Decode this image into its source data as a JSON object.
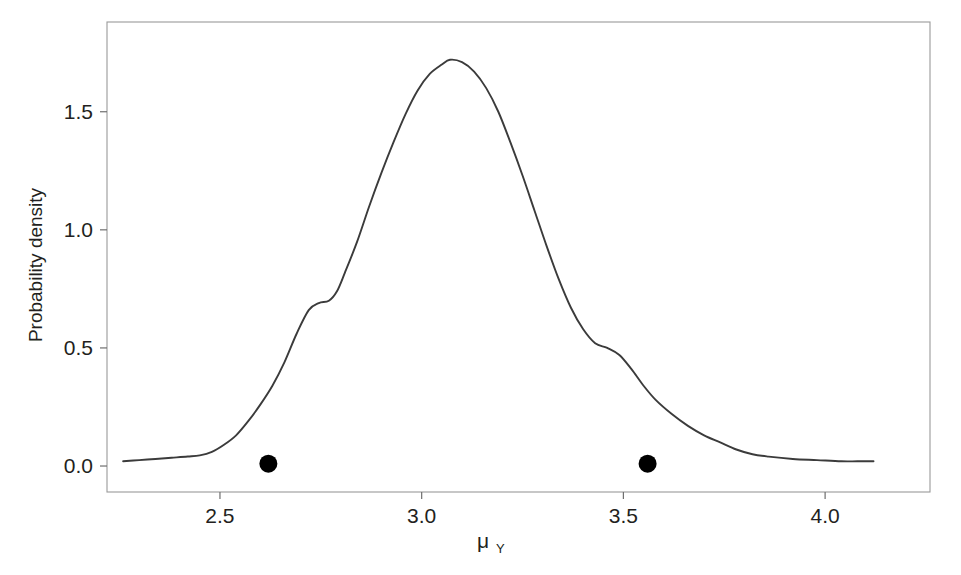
{
  "chart_data": {
    "type": "line",
    "title": "",
    "subtitle": "",
    "xlabel": "μ",
    "xlabel_subscript": "Y",
    "ylabel": "Probability density",
    "xlim": [
      2.22,
      4.26
    ],
    "ylim": [
      -0.11,
      1.88
    ],
    "xticks": [
      2.5,
      3.0,
      3.5,
      4.0
    ],
    "xtick_labels": [
      "2.5",
      "3.0",
      "3.5",
      "4.0"
    ],
    "yticks": [
      0.0,
      0.5,
      1.0,
      1.5
    ],
    "ytick_labels": [
      "0.0",
      "0.5",
      "1.0",
      "1.5"
    ],
    "grid": false,
    "legend": null,
    "line_color": "#3b3b3b",
    "marker_color": "#000000",
    "frame_color": "#8c8c8c",
    "background": "#ffffff",
    "series": [
      {
        "name": "posterior density",
        "type": "line",
        "x": [
          2.26,
          2.3,
          2.34,
          2.38,
          2.42,
          2.45,
          2.48,
          2.51,
          2.54,
          2.57,
          2.6,
          2.63,
          2.66,
          2.69,
          2.72,
          2.745,
          2.77,
          2.79,
          2.81,
          2.84,
          2.87,
          2.9,
          2.93,
          2.96,
          2.99,
          3.02,
          3.05,
          3.07,
          3.1,
          3.13,
          3.16,
          3.19,
          3.22,
          3.25,
          3.28,
          3.31,
          3.34,
          3.37,
          3.4,
          3.43,
          3.46,
          3.49,
          3.52,
          3.55,
          3.58,
          3.62,
          3.66,
          3.7,
          3.74,
          3.78,
          3.82,
          3.86,
          3.92,
          3.98,
          4.04,
          4.08,
          4.12
        ],
        "y": [
          0.02,
          0.025,
          0.03,
          0.035,
          0.04,
          0.045,
          0.06,
          0.09,
          0.13,
          0.19,
          0.26,
          0.34,
          0.44,
          0.56,
          0.66,
          0.69,
          0.7,
          0.74,
          0.82,
          0.95,
          1.1,
          1.24,
          1.37,
          1.49,
          1.59,
          1.66,
          1.7,
          1.72,
          1.71,
          1.67,
          1.6,
          1.5,
          1.37,
          1.23,
          1.08,
          0.93,
          0.79,
          0.67,
          0.58,
          0.52,
          0.5,
          0.47,
          0.41,
          0.34,
          0.28,
          0.22,
          0.17,
          0.13,
          0.1,
          0.07,
          0.05,
          0.04,
          0.03,
          0.025,
          0.02,
          0.02,
          0.02
        ]
      },
      {
        "name": "observed points",
        "type": "scatter",
        "x": [
          2.62,
          3.56
        ],
        "y": [
          0.01,
          0.01
        ],
        "marker": "filled-circle",
        "marker_size": 9
      }
    ],
    "annotations": [
      {
        "label": "left shoulder",
        "x": 2.72,
        "y": 0.69
      },
      {
        "label": "mode",
        "x": 3.07,
        "y": 1.72
      },
      {
        "label": "right shoulder",
        "x": 3.44,
        "y": 0.5
      }
    ]
  }
}
